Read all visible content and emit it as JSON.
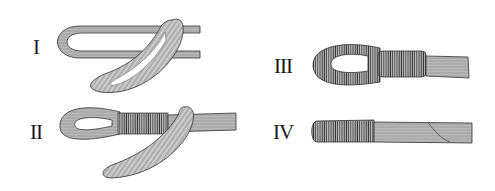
{
  "figure": {
    "background": "#ffffff",
    "ink": "#2a2a2a",
    "panels": [
      {
        "label": "I",
        "caption_pos": [
          33,
          37
        ],
        "depicts": "strand bundle folded back into loop, crossed"
      },
      {
        "label": "II",
        "caption_pos": [
          30,
          122
        ],
        "depicts": "eye formed with partial whipping, loose ends hanging"
      },
      {
        "label": "III",
        "caption_pos": [
          274,
          56
        ],
        "depicts": "fully whipped eye with served neck and frayed tail"
      },
      {
        "label": "IV",
        "caption_pos": [
          273,
          122
        ],
        "depicts": "whipped end with frayed tail"
      }
    ]
  }
}
